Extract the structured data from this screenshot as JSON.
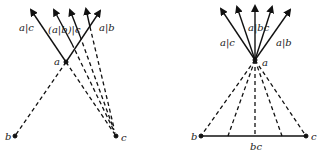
{
  "left_diagram": {
    "labels": {
      "a": "a",
      "b": "b",
      "c": "c",
      "a_given_c": "a|c",
      "a_given_b_given_c": "(a|b)|c",
      "a_given_b": "a|b"
    }
  },
  "right_diagram": {
    "labels": {
      "a": "a",
      "b": "b",
      "c": "c",
      "bc": "bc",
      "a_given_c": "a|c",
      "a_given_bc": "a|bc",
      "a_given_b": "a|b"
    }
  },
  "colors": {
    "line": "#111111",
    "background": "#ffffff"
  }
}
